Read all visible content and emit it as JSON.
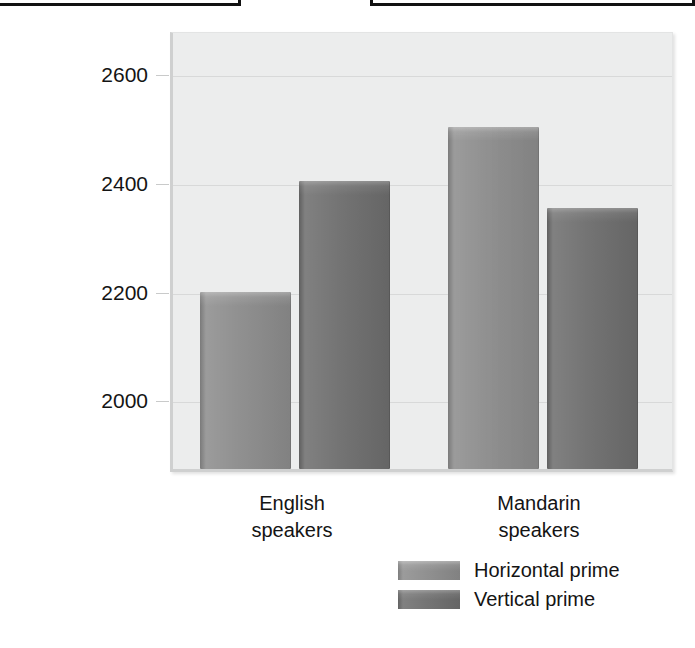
{
  "top_boxes": [
    {
      "name": "cropped-box-left"
    },
    {
      "name": "cropped-box-right"
    }
  ],
  "chart_data": {
    "type": "bar",
    "title": "",
    "xlabel": "",
    "ylabel": "RT (m secs)",
    "categories": [
      "English\nspeakers",
      "Mandarin\nspeakers"
    ],
    "category_labels": [
      {
        "line1": "English",
        "line2": "speakers"
      },
      {
        "line1": "Mandarin",
        "line2": "speakers"
      }
    ],
    "series": [
      {
        "name": "Horizontal prime",
        "color": "#8b8b8b",
        "values": [
          2195,
          2500
        ]
      },
      {
        "name": "Vertical prime",
        "color": "#6f6f6f",
        "values": [
          2400,
          2350
        ]
      }
    ],
    "yticks": [
      2000,
      2200,
      2400,
      2600
    ],
    "ytick_labels": [
      "2000",
      "2200",
      "2400",
      "2600"
    ],
    "ylim": [
      1870,
      2680
    ],
    "grid": true,
    "legend_position": "bottom-right",
    "plot_background": "#eceded",
    "gridline_color": "#d8d9d9"
  },
  "legend": {
    "items": [
      {
        "label": "Horizontal prime",
        "swatch": "series-h"
      },
      {
        "label": "Vertical prime",
        "swatch": "series-v"
      }
    ]
  }
}
